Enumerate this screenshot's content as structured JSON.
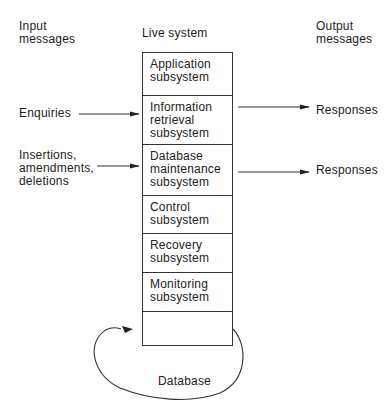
{
  "headers": {
    "input": "Input\nmessages",
    "live": "Live system",
    "output": "Output\nmessages"
  },
  "inputs": [
    {
      "label": "Enquiries",
      "target": "Information retrieval subsystem"
    },
    {
      "label": "Insertions,\namendments,\ndeletions",
      "target": "Database maintenance subsystem"
    }
  ],
  "outputs": [
    {
      "label": "Responses",
      "source": "Information retrieval subsystem"
    },
    {
      "label": "Responses",
      "source": "Database maintenance subsystem"
    }
  ],
  "subsystems": [
    {
      "label": "Application\nsubsystem"
    },
    {
      "label": "Information\nretrieval\nsubsystem"
    },
    {
      "label": "Database\nmaintenance\nsubsystem"
    },
    {
      "label": "Control\nsubsystem"
    },
    {
      "label": "Recovery\nsubsystem"
    },
    {
      "label": "Monitoring\nsubsystem"
    },
    {
      "label": ""
    }
  ],
  "database": {
    "label": "Database"
  },
  "colors": {
    "line": "#333333",
    "text": "#222222",
    "background": "#ffffff"
  }
}
